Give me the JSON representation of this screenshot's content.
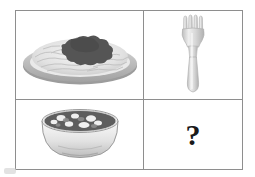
{
  "puzzle": {
    "type": "visual-analogy",
    "layout": "2x2 grid",
    "relation": "food item is eaten with its matching utensil",
    "cells": [
      {
        "position": "top-left",
        "content_type": "image",
        "icon": "plate-of-spaghetti-icon",
        "label": "plate of spaghetti with sauce"
      },
      {
        "position": "top-right",
        "content_type": "image",
        "icon": "fork-icon",
        "label": "fork"
      },
      {
        "position": "bottom-left",
        "content_type": "image",
        "icon": "bowl-of-soup-icon",
        "label": "bowl of soup"
      },
      {
        "position": "bottom-right",
        "content_type": "text",
        "icon": "question-mark-icon",
        "label": "?",
        "text": "?"
      }
    ]
  },
  "colors": {
    "border": "#8e8e8e",
    "background": "#ffffff",
    "question_mark": "#1a1a1a",
    "plate_rim": "#a9a9a9",
    "noodles": "#e6e6e6",
    "sauce": "#555555",
    "fork_metal": "#d4d4d4",
    "fork_outline": "#b3b3b3",
    "bowl_body": "#efefef",
    "bowl_outline": "#9a9a9a",
    "soup_broth": "#5e5e5e",
    "soup_chunk": "#efefef"
  }
}
